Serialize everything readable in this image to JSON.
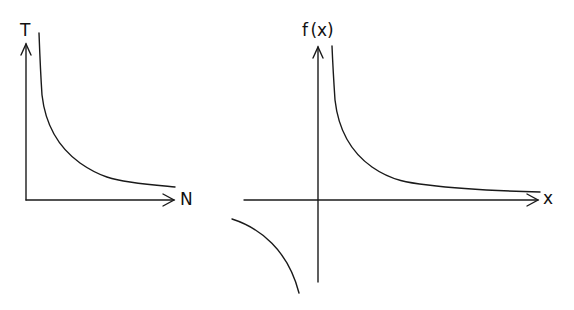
{
  "diagrams": [
    {
      "name": "T vs N",
      "y_label": "T",
      "x_label": "N",
      "curve": "decreasing hyperbola (T ∝ 1/N)"
    },
    {
      "name": "f(x) = 1/x",
      "y_label": "f (x)",
      "x_label": "x",
      "curve": "rectangular hyperbola, two branches in quadrants I and III"
    }
  ],
  "colors": {
    "stroke": "#1a1a1a",
    "background": "#ffffff"
  }
}
